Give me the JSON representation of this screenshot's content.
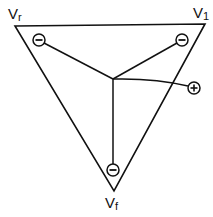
{
  "diagram": {
    "type": "triangle-electrode-schematic",
    "colors": {
      "stroke": "#111111",
      "background": "#ffffff"
    },
    "vertices": [
      {
        "id": "Vr",
        "base": "V",
        "sub": "r",
        "x": 15,
        "y": 26
      },
      {
        "id": "V1",
        "base": "V",
        "sub": "1",
        "x": 205,
        "y": 24
      },
      {
        "id": "Vf",
        "base": "V",
        "sub": "f",
        "x": 114,
        "y": 191
      }
    ],
    "center": {
      "x": 113,
      "y": 79
    },
    "electrodes": [
      {
        "id": "electrode-r",
        "sign": "−",
        "symbol": "minus",
        "x": 39,
        "y": 40
      },
      {
        "id": "electrode-1",
        "sign": "−",
        "symbol": "minus",
        "x": 182,
        "y": 40
      },
      {
        "id": "electrode-f",
        "sign": "−",
        "symbol": "minus",
        "x": 113,
        "y": 170
      },
      {
        "id": "electrode-plus",
        "sign": "+",
        "symbol": "plus",
        "x": 194,
        "y": 88
      }
    ],
    "labels": {
      "vr": {
        "base": "V",
        "sub": "r"
      },
      "v1": {
        "base": "V",
        "sub": "1"
      },
      "vf": {
        "base": "V",
        "sub": "f"
      }
    }
  }
}
